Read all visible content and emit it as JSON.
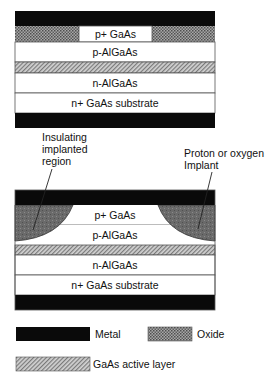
{
  "colors": {
    "metal": "#0a0a0a",
    "oxide_fg": "#5a5a5a",
    "oxide_bg": "#a8a8a8",
    "active_fg": "#6e6e6e",
    "active_bg": "#d0d0d0",
    "implant": "#6c6c6c",
    "layer_bg": "#ffffff",
    "outline": "#555555"
  },
  "top_device": {
    "layers": {
      "p_plus": "p+ GaAs",
      "p_algaas": "p-AlGaAs",
      "n_algaas": "n-AlGaAs",
      "substrate": "n+ GaAs substrate"
    }
  },
  "bottom_device": {
    "layers": {
      "p_plus": "p+ GaAs",
      "p_algaas": "p-AlGaAs",
      "n_algaas": "n-AlGaAs",
      "substrate": "n+ GaAs substrate"
    },
    "callouts": {
      "left": [
        "Insulating",
        "implanted",
        "region"
      ],
      "right": [
        "Proton or oxygen",
        "Implant"
      ]
    }
  },
  "legend": {
    "metal": "Metal",
    "oxide": "Oxide",
    "active": "GaAs active layer"
  }
}
